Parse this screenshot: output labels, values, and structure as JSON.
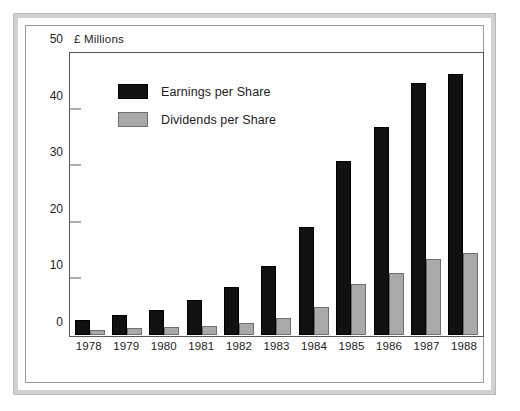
{
  "chart_data": {
    "type": "bar",
    "title": "",
    "ylabel": "£ Millions",
    "xlabel": "",
    "ylim": [
      0,
      50
    ],
    "yticks": [
      0,
      10,
      20,
      30,
      40,
      50
    ],
    "grid": false,
    "legend_position": "upper-left-inside",
    "categories": [
      "1978",
      "1979",
      "1980",
      "1981",
      "1982",
      "1983",
      "1984",
      "1985",
      "1986",
      "1987",
      "1988"
    ],
    "series": [
      {
        "name": "Earnings per Share",
        "color": "#111111",
        "values": [
          2.6,
          3.6,
          4.4,
          6.3,
          8.5,
          12.3,
          19.2,
          31.0,
          37.0,
          44.8,
          46.5
        ]
      },
      {
        "name": "Dividends per Share",
        "color": "#a9a9a9",
        "values": [
          0.9,
          1.2,
          1.4,
          1.6,
          2.2,
          3.1,
          5.0,
          9.0,
          11.0,
          13.6,
          14.6
        ]
      }
    ]
  },
  "colors": {
    "earnings": "#111111",
    "dividends": "#a9a9a9",
    "frame": "#d2d2d2",
    "axis": "#565656",
    "text": "#1d1d1d"
  }
}
